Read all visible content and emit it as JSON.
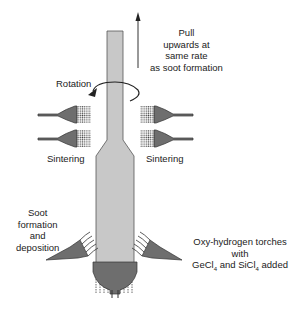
{
  "labels": {
    "pull": [
      "Pull",
      "upwards at",
      "same rate",
      "as soot formation"
    ],
    "rotation": "Rotation",
    "sintering_left": "Sintering",
    "sintering_right": "Sintering",
    "soot": [
      "Soot",
      "formation",
      "and",
      "deposition"
    ],
    "torches": [
      "Oxy-hydrogen torches",
      "with"
    ],
    "torches_line3": {
      "a": "GeCl",
      "sub1": "4",
      "b": " and SiCl",
      "sub2": "4",
      "c": " added"
    }
  },
  "colors": {
    "rod": "#c8c8c8",
    "torch": "#6e6e6e",
    "outline": "#333333"
  }
}
